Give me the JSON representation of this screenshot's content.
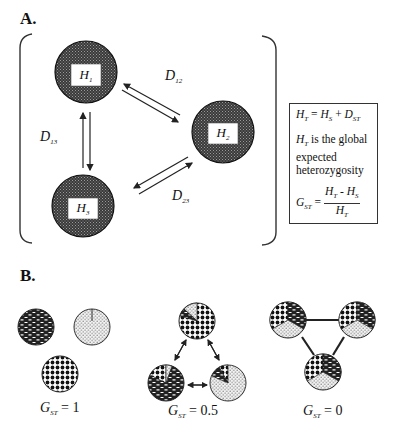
{
  "panel_a": {
    "label": "A.",
    "nodes": [
      {
        "id": "H1",
        "label": "H",
        "sub": "1",
        "cx": 86,
        "cy": 72
      },
      {
        "id": "H2",
        "label": "H",
        "sub": "2",
        "cx": 223,
        "cy": 132
      },
      {
        "id": "H3",
        "label": "H",
        "sub": "3",
        "cx": 83,
        "cy": 206
      }
    ],
    "distances": [
      {
        "label": "D",
        "sub": "12"
      },
      {
        "label": "D",
        "sub": "13"
      },
      {
        "label": "D",
        "sub": "23"
      }
    ],
    "formula_box": {
      "line1": {
        "lhs": "H",
        "lhs_sub": "T",
        "eq": " = ",
        "a": "H",
        "a_sub": "S",
        "op": " + ",
        "b": "D",
        "b_sub": "ST"
      },
      "line2_var": "H",
      "line2_sub": "T",
      "line2_text": " is the global expected heterozygosity",
      "line3": {
        "lhs": "G",
        "lhs_sub": "ST",
        "eq": " = ",
        "num_a": "H",
        "num_a_sub": "T",
        "num_op": " - ",
        "num_b": "H",
        "num_b_sub": "S",
        "den": "H",
        "den_sub": "T"
      }
    },
    "colors": {
      "node_fill": "#3a3a3a",
      "node_dots": "#9a9a9a",
      "line": "#222222"
    }
  },
  "panel_b": {
    "label": "B.",
    "scenarios": [
      {
        "gst_var": "G",
        "gst_sub": "ST",
        "gst_value": " = 1"
      },
      {
        "gst_var": "G",
        "gst_sub": "ST",
        "gst_value": " = 0.5"
      },
      {
        "gst_var": "G",
        "gst_sub": "ST",
        "gst_value": " = 0"
      }
    ],
    "allele_patterns": [
      "brick",
      "checker",
      "dots"
    ]
  }
}
